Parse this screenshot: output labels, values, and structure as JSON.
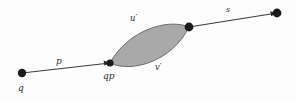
{
  "figure": {
    "type": "mathematical-diagram",
    "background_color": "#fdfdfd",
    "stroke_color": "#3a3a3a",
    "lens_fill_color": "#a9a9a9",
    "lens_stroke_color": "#6e6e6e",
    "vertex_color": "#1a1a1a"
  },
  "labels": {
    "q": "q",
    "p": "p",
    "qp": "qp",
    "u_prime": "u′",
    "v_prime": "v′",
    "s": "s"
  },
  "vertices": [
    {
      "name": "q-vertex",
      "x": 22,
      "y": 73,
      "r": 4.2
    },
    {
      "name": "qp-vertex",
      "x": 110,
      "y": 63,
      "r": 3.6
    },
    {
      "name": "lens-right-vertex",
      "x": 189,
      "y": 27,
      "r": 4.4
    },
    {
      "name": "s-endpoint-vertex",
      "x": 277,
      "y": 13,
      "r": 4.4
    }
  ],
  "edges": [
    {
      "name": "edge-p",
      "label": "p",
      "from": "q-vertex",
      "to": "qp-vertex",
      "arrow": true
    },
    {
      "name": "edge-s",
      "label": "s",
      "from": "lens-right-vertex",
      "to": "s-endpoint-vertex",
      "arrow": true
    }
  ],
  "lens": {
    "name": "bigon-region",
    "upper_arc_label": "u′",
    "lower_arc_label": "v′",
    "left_vertex": "qp-vertex",
    "right_vertex": "lens-right-vertex"
  }
}
